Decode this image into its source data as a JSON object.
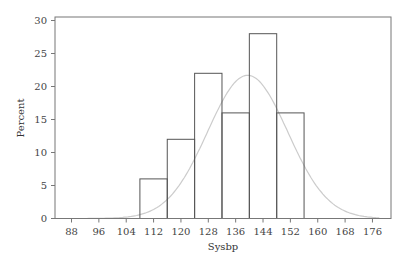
{
  "chart_data": {
    "type": "bar",
    "subtype": "histogram_with_normal_curve",
    "title": "",
    "xlabel": "Sysbp",
    "ylabel": "Percent",
    "bins": [
      {
        "start": 108,
        "end": 116,
        "value": 6
      },
      {
        "start": 116,
        "end": 124,
        "value": 12
      },
      {
        "start": 124,
        "end": 132,
        "value": 22
      },
      {
        "start": 132,
        "end": 140,
        "value": 16
      },
      {
        "start": 140,
        "end": 148,
        "value": 28
      },
      {
        "start": 148,
        "end": 156,
        "value": 16
      }
    ],
    "categories": [
      "112",
      "120",
      "128",
      "136",
      "144",
      "152"
    ],
    "values": [
      6,
      12,
      22,
      16,
      28,
      16
    ],
    "normal_curve": {
      "mean": 139.5,
      "sd": 11.7,
      "peak_percent": 21.7,
      "color": "#cccccc"
    },
    "x_ticks": [
      88,
      96,
      104,
      112,
      120,
      128,
      136,
      144,
      152,
      160,
      168,
      176
    ],
    "y_ticks": [
      0,
      5,
      10,
      15,
      20,
      25,
      30
    ],
    "xlim": [
      83,
      181
    ],
    "ylim": [
      0,
      30
    ],
    "grid": false,
    "legend": null,
    "bar_fill": "#ffffff",
    "bar_stroke": "#555555"
  }
}
